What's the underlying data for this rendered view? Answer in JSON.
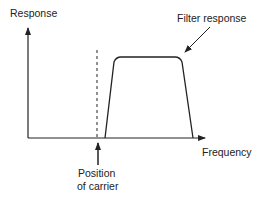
{
  "diagram": {
    "y_axis_label": "Response",
    "x_axis_label": "Frequency",
    "curve_label": "Filter response",
    "marker_label_line1": "Position",
    "marker_label_line2": "of carrier"
  },
  "colors": {
    "line": "#222222",
    "background": "#ffffff"
  }
}
